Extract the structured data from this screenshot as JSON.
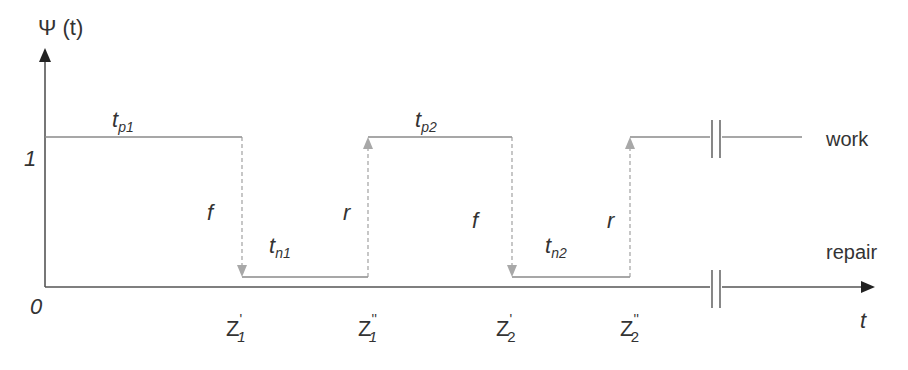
{
  "diagram": {
    "y_axis_label": "Ψ (t)",
    "x_axis_label": "t",
    "y_levels": {
      "one": "1",
      "zero": "0"
    },
    "state_labels": {
      "work": "work",
      "repair": "repair"
    },
    "durations": {
      "tp1": {
        "main": "t",
        "sub": "p1"
      },
      "tp2": {
        "main": "t",
        "sub": "p2"
      },
      "tn1": {
        "main": "t",
        "sub": "n1"
      },
      "tn2": {
        "main": "t",
        "sub": "n2"
      }
    },
    "transitions": {
      "f1": "f",
      "r1": "r",
      "f2": "f",
      "r2": "r"
    },
    "time_marks": [
      {
        "main": "Z",
        "prime": "'",
        "sub": "1"
      },
      {
        "main": "Z",
        "prime": "''",
        "sub": "1"
      },
      {
        "main": "Z",
        "prime": "'",
        "sub": "2"
      },
      {
        "main": "Z",
        "prime": "''",
        "sub": "2"
      }
    ],
    "colors": {
      "axis": "#555555",
      "signal": "#888888",
      "arrow_gray": "#a8a8a8",
      "text": "#333333"
    }
  }
}
